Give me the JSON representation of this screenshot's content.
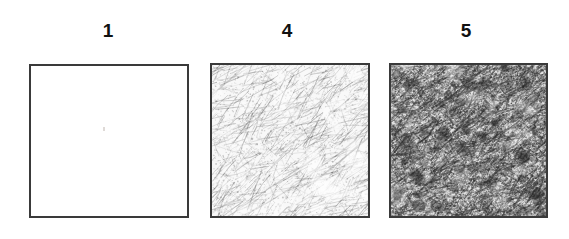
{
  "figure": {
    "background_color": "#ffffff",
    "border_color": "#3a3a3a",
    "label_color": "#111111",
    "width": 569,
    "height": 239
  },
  "panels": [
    {
      "label": "1",
      "label_x": 108,
      "label_y": 21,
      "box_x": 29,
      "box_y": 64,
      "box_w": 160,
      "box_h": 154,
      "texture": "blank",
      "density": 0,
      "ink_color": "#000000",
      "mean_gray": "#ffffff",
      "description": "blank white square"
    },
    {
      "label": "4",
      "label_x": 287,
      "label_y": 21,
      "box_x": 210,
      "box_y": 63,
      "box_w": 160,
      "box_h": 155,
      "texture": "scribble",
      "density": 1400,
      "ink_color": "#5d5d5d",
      "mean_gray": "#d8d8d8",
      "description": "light grey mottled fibrous texture with diagonal streaks"
    },
    {
      "label": "5",
      "label_x": 466,
      "label_y": 21,
      "box_x": 389,
      "box_y": 63,
      "box_w": 159,
      "box_h": 155,
      "texture": "scribble",
      "density": 4200,
      "ink_color": "#3a3a3a",
      "mean_gray": "#a8a8a8",
      "description": "dark dense scribbled texture, heavily filled"
    }
  ],
  "chart_data": {
    "type": "heatmap",
    "title": "",
    "xlabel": "",
    "ylabel": "",
    "categories": [
      "1",
      "4",
      "5"
    ],
    "values": [
      0,
      1400,
      4200
    ],
    "series": [
      {
        "name": "fill density (marks per panel)",
        "values": [
          0,
          1400,
          4200
        ]
      }
    ],
    "annotations": [
      "Panel 1 is empty (white).",
      "Panel 4 shows a light grey fibrous/streaked fill.",
      "Panel 5 shows a dark dense scribbled fill."
    ],
    "legend_position": "none",
    "grid": false
  }
}
